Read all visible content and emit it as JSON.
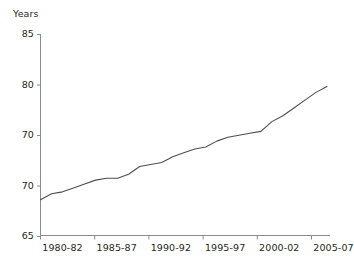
{
  "chart_data": {
    "type": "line",
    "title": "",
    "subtitle": "",
    "xlabel": "",
    "ylabel": "Years",
    "ylim": [
      65,
      85
    ],
    "xlim": [
      1980,
      2006
    ],
    "grid": false,
    "legend": null,
    "y_ticks": [
      85,
      80,
      70,
      70,
      65
    ],
    "y_tick_labels": [
      "85",
      "80",
      "70",
      "70",
      "65"
    ],
    "y_tick_values": [
      85,
      80,
      75,
      70,
      65
    ],
    "x_tick_labels": [
      "1980-82",
      "1985-87",
      "1990-92",
      "1995-97",
      "2000-02",
      "2005-07"
    ],
    "x_tick_values": [
      1980,
      1985,
      1990,
      1995,
      2000,
      2005
    ],
    "line_color": "#4d4d4d",
    "axis_color": "#8c8c8c",
    "series": [
      {
        "name": "Life expectancy",
        "x": [
          1980,
          1981,
          1982,
          1983,
          1984,
          1985,
          1986,
          1987,
          1988,
          1989,
          1990,
          1991,
          1992,
          1993,
          1994,
          1995,
          1996,
          1997,
          1998,
          1999,
          2000,
          2001,
          2002,
          2003,
          2004,
          2005,
          2006
        ],
        "values": [
          68.6,
          68.9,
          69.0,
          69.2,
          69.4,
          69.6,
          69.7,
          69.7,
          69.9,
          70.3,
          70.4,
          70.5,
          70.8,
          71.0,
          71.2,
          71.3,
          71.6,
          71.8,
          71.9,
          72.0,
          72.1,
          72.6,
          72.9,
          73.3,
          73.7,
          74.1,
          74.4
        ]
      }
    ],
    "series_extended": {
      "x": [
        1980,
        1981,
        1982,
        1983,
        1984,
        1985,
        1986,
        1987,
        1988,
        1989,
        1990,
        1991,
        1992,
        1993,
        1994,
        1995,
        1996,
        1997,
        1998,
        1999,
        2000,
        2001,
        2002,
        2003,
        2004,
        2005
      ],
      "values": [
        68.6,
        68.9,
        69.0,
        69.2,
        69.4,
        69.6,
        69.7,
        69.7,
        69.9,
        70.3,
        70.4,
        70.5,
        70.8,
        71.0,
        71.2,
        71.3,
        71.6,
        71.8,
        71.9,
        72.0,
        72.1,
        72.6,
        72.9,
        73.3,
        73.7,
        74.1
      ]
    },
    "start_value": 68.6,
    "end_value": 79.8
  }
}
